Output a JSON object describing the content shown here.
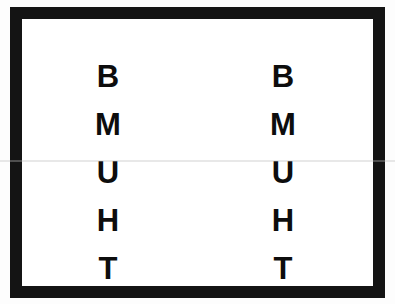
{
  "card": {
    "title": "Vision Acuity Letter Card",
    "background_color": "#fdfdfd",
    "frame_color": "#141414",
    "field_color": "#ffffff",
    "letter_color": "#0d0d0d"
  },
  "columns": [
    {
      "id": "left",
      "name": "left-letter-column",
      "letters": [
        "B",
        "M",
        "U",
        "H",
        "T"
      ]
    },
    {
      "id": "right",
      "name": "right-letter-column",
      "letters": [
        "B",
        "M",
        "U",
        "H",
        "T"
      ]
    }
  ]
}
